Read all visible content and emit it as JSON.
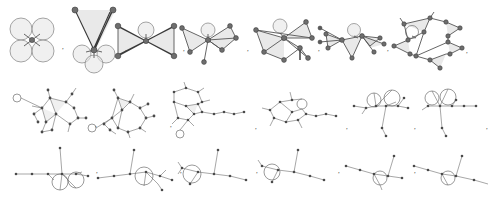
{
  "figure": {
    "background_color": "#ffffff",
    "separator": ",",
    "node_color": "#6e6e6e",
    "edge_color": "#555555",
    "face_color": "#c9c9c9",
    "loop_color": "#e3e3e3",
    "row_count": 3,
    "item_count": 21
  },
  "rows": [
    {
      "id": "row-top",
      "style": "shaded",
      "y": 0,
      "height": 78,
      "items": [
        {
          "label": "graph-1",
          "name": "four-loop-flower",
          "nodes": 1,
          "loops": 4,
          "faces": 0
        },
        {
          "label": "graph-2",
          "name": "three-loop-two-apex",
          "nodes": 3,
          "loops": 3,
          "faces": 2
        },
        {
          "label": "graph-3",
          "name": "bowtie-one-loop",
          "nodes": 5,
          "loops": 1,
          "faces": 2
        },
        {
          "label": "graph-4",
          "name": "fan-one-loop",
          "nodes": 7,
          "loops": 1,
          "faces": 3
        },
        {
          "label": "graph-5",
          "name": "star-triangulation",
          "nodes": 8,
          "loops": 1,
          "faces": 4
        },
        {
          "label": "graph-6",
          "name": "double-fan-loop",
          "nodes": 9,
          "loops": 1,
          "faces": 4
        },
        {
          "label": "graph-7",
          "name": "pentagon-spiked",
          "nodes": 11,
          "loops": 1,
          "faces": 5
        }
      ]
    },
    {
      "id": "row-middle",
      "style": "line",
      "y": 80,
      "height": 60,
      "items": [
        {
          "label": "graph-8",
          "name": "tangled-polygon-a",
          "nodes": 14,
          "loops": 1,
          "faces": 2
        },
        {
          "label": "graph-9",
          "name": "tangled-polygon-b",
          "nodes": 15,
          "loops": 1,
          "faces": 1
        },
        {
          "label": "graph-10",
          "name": "ring-with-tail-a",
          "nodes": 16,
          "loops": 1,
          "faces": 1
        },
        {
          "label": "graph-11",
          "name": "ring-with-tail-b",
          "nodes": 15,
          "loops": 1,
          "faces": 0
        },
        {
          "label": "graph-12",
          "name": "twin-ring-a",
          "nodes": 14,
          "loops": 2,
          "faces": 0
        },
        {
          "label": "graph-13",
          "name": "twin-ring-b",
          "nodes": 13,
          "loops": 2,
          "faces": 0
        }
      ]
    },
    {
      "id": "row-bottom",
      "style": "line",
      "y": 142,
      "height": 57,
      "items": [
        {
          "label": "graph-14",
          "name": "twin-lobe-stem",
          "nodes": 12,
          "loops": 2,
          "faces": 0
        },
        {
          "label": "graph-15",
          "name": "lobe-fork-a",
          "nodes": 11,
          "loops": 1,
          "faces": 0
        },
        {
          "label": "graph-16",
          "name": "lobe-fork-b",
          "nodes": 10,
          "loops": 1,
          "faces": 0
        },
        {
          "label": "graph-17",
          "name": "single-lobe-branch",
          "nodes": 9,
          "loops": 1,
          "faces": 0
        },
        {
          "label": "graph-18",
          "name": "small-lobe-chain-a",
          "nodes": 8,
          "loops": 1,
          "faces": 0
        },
        {
          "label": "graph-19",
          "name": "small-lobe-chain-b",
          "nodes": 7,
          "loops": 1,
          "faces": 0
        }
      ]
    }
  ]
}
